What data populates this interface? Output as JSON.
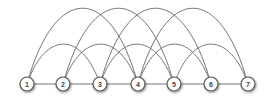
{
  "diagram": {
    "type": "arc-graph",
    "nodes": [
      {
        "id": "1",
        "label": "1",
        "x": 27,
        "y": 84
      },
      {
        "id": "2",
        "label": "2",
        "x": 63,
        "y": 84
      },
      {
        "id": "3",
        "label": "3",
        "x": 100,
        "y": 84
      },
      {
        "id": "4",
        "label": "4",
        "x": 138,
        "y": 84
      },
      {
        "id": "5",
        "label": "5",
        "x": 174,
        "y": 84
      },
      {
        "id": "6",
        "label": "6",
        "x": 211,
        "y": 84
      },
      {
        "id": "7",
        "label": "7",
        "x": 248,
        "y": 84
      }
    ],
    "line_edges": [
      [
        "1",
        "2"
      ],
      [
        "2",
        "3"
      ],
      [
        "3",
        "4"
      ],
      [
        "4",
        "5"
      ],
      [
        "5",
        "6"
      ],
      [
        "6",
        "7"
      ]
    ],
    "short_arcs": [
      [
        "1",
        "3"
      ],
      [
        "2",
        "4"
      ],
      [
        "3",
        "5"
      ],
      [
        "4",
        "6"
      ],
      [
        "5",
        "7"
      ]
    ],
    "tall_arcs": [
      [
        "1",
        "4"
      ],
      [
        "2",
        "5"
      ],
      [
        "3",
        "6"
      ],
      [
        "4",
        "7"
      ]
    ],
    "colors": {
      "edge": "#777777",
      "node_fill": "#ffffff",
      "node_stroke": "#555555",
      "label": "#444444"
    }
  }
}
